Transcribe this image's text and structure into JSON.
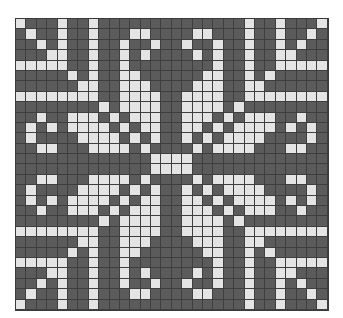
{
  "chart": {
    "type": "knitting-chart",
    "columns": 30,
    "rows": 28,
    "symmetry": "mirrored horizontally and vertically",
    "colors": {
      "background": "#5b5b5b",
      "stitch": "#e4e4e4",
      "gridline": "#3e3e3e"
    },
    "quadrant_top_left_light_cells": [
      [
        0,
        4,
        7
      ],
      [
        1,
        4,
        7,
        11,
        12
      ],
      [
        2,
        4,
        7,
        10,
        13
      ],
      [
        3,
        4,
        7,
        10,
        12
      ],
      [
        0,
        1,
        2,
        3,
        4,
        7,
        10
      ],
      [
        5,
        7,
        10,
        11
      ],
      [
        6,
        7,
        10,
        11,
        12
      ],
      [
        0,
        1,
        2,
        3,
        4,
        5,
        6,
        7,
        10,
        11,
        12,
        13
      ],
      [
        8,
        10,
        11,
        12,
        13
      ],
      [
        2,
        5,
        6,
        7,
        9,
        11,
        12,
        13
      ],
      [
        1,
        3,
        5,
        6,
        7,
        8,
        10,
        12,
        13
      ],
      [
        1,
        6,
        7,
        8,
        9,
        11,
        13
      ],
      [
        2,
        3,
        7,
        8,
        9,
        10,
        12
      ],
      [
        13,
        14
      ]
    ]
  }
}
